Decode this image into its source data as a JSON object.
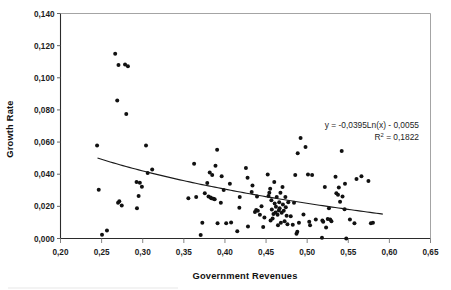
{
  "chart_data": {
    "type": "scatter",
    "title": "",
    "xlabel": "Government Revenues",
    "ylabel": "Growth Rate",
    "xlim": [
      0.2,
      0.65
    ],
    "ylim": [
      0.0,
      0.14
    ],
    "grid": false,
    "legend": null,
    "x_ticks": [
      "0,20",
      "0,25",
      "0,30",
      "0,35",
      "0,40",
      "0,45",
      "0,50",
      "0,55",
      "0,60",
      "0,65"
    ],
    "x_tick_values": [
      0.2,
      0.25,
      0.3,
      0.35,
      0.4,
      0.45,
      0.5,
      0.55,
      0.6,
      0.65
    ],
    "y_ticks": [
      "0,000",
      "0,020",
      "0,040",
      "0,060",
      "0,080",
      "0,100",
      "0,120",
      "0,140"
    ],
    "y_tick_values": [
      0.0,
      0.02,
      0.04,
      0.06,
      0.08,
      0.1,
      0.12,
      0.14
    ],
    "decimal_separator": ",",
    "annotations": {
      "equation": "y = -0,0395Ln(x) - 0,0055",
      "equation_prefix": "y = -0,0395Ln(x) - 0,0055",
      "r_squared_prefix": "R",
      "r_squared_sup": "2",
      "r_squared_value": " = 0,1822",
      "r_squared_full": "R² = 0,1822",
      "position": "upper-right"
    },
    "trendline": {
      "type": "logarithmic",
      "equation": "y = -0.0395*ln(x) - 0.0055",
      "coefficient": -0.0395,
      "intercept": -0.0055,
      "r_squared": 0.1822,
      "x_start": 0.245,
      "x_end": 0.592,
      "color": "#1a1a1a"
    },
    "marker": {
      "shape": "circle",
      "color": "#111111",
      "size": 2.0
    },
    "series": [
      {
        "name": "Countries",
        "points": [
          [
            0.2445,
            0.0578
          ],
          [
            0.2465,
            0.0303
          ],
          [
            0.2505,
            0.0023
          ],
          [
            0.2565,
            0.005
          ],
          [
            0.2665,
            0.115
          ],
          [
            0.269,
            0.0858
          ],
          [
            0.27,
            0.0222
          ],
          [
            0.2705,
            0.108
          ],
          [
            0.2715,
            0.0232
          ],
          [
            0.2745,
            0.0205
          ],
          [
            0.2785,
            0.1082
          ],
          [
            0.28,
            0.0775
          ],
          [
            0.282,
            0.1072
          ],
          [
            0.2925,
            0.0352
          ],
          [
            0.293,
            0.0188
          ],
          [
            0.295,
            0.0265
          ],
          [
            0.2965,
            0.0347
          ],
          [
            0.299,
            0.0322
          ],
          [
            0.304,
            0.0578
          ],
          [
            0.306,
            0.0408
          ],
          [
            0.3115,
            0.043
          ],
          [
            0.3555,
            0.025
          ],
          [
            0.3625,
            0.0465
          ],
          [
            0.365,
            0.0258
          ],
          [
            0.3705,
            0.0022
          ],
          [
            0.3725,
            0.0098
          ],
          [
            0.3755,
            0.0282
          ],
          [
            0.3785,
            0.0345
          ],
          [
            0.38,
            0.0262
          ],
          [
            0.3815,
            0.041
          ],
          [
            0.3825,
            0.0255
          ],
          [
            0.3835,
            0.025
          ],
          [
            0.3845,
            0.0395
          ],
          [
            0.386,
            0.0248
          ],
          [
            0.3875,
            0.0245
          ],
          [
            0.3885,
            0.0452
          ],
          [
            0.3905,
            0.0553
          ],
          [
            0.391,
            0.0095
          ],
          [
            0.395,
            0.0222
          ],
          [
            0.396,
            0.0388
          ],
          [
            0.3985,
            0.0302
          ],
          [
            0.4015,
            0.0095
          ],
          [
            0.406,
            0.034
          ],
          [
            0.4075,
            0.01
          ],
          [
            0.415,
            0.0045
          ],
          [
            0.4175,
            0.0192
          ],
          [
            0.418,
            0.0258
          ],
          [
            0.4255,
            0.0438
          ],
          [
            0.4275,
            0.0378
          ],
          [
            0.428,
            0.0075
          ],
          [
            0.4325,
            0.029
          ],
          [
            0.4335,
            0.033
          ],
          [
            0.4365,
            0.0165
          ],
          [
            0.438,
            0.0178
          ],
          [
            0.439,
            0.0262
          ],
          [
            0.44,
            0.0172
          ],
          [
            0.4425,
            0.0148
          ],
          [
            0.4445,
            0.02
          ],
          [
            0.4465,
            0.0072
          ],
          [
            0.448,
            0.013
          ],
          [
            0.452,
            0.0398
          ],
          [
            0.453,
            0.0265
          ],
          [
            0.454,
            0.0285
          ],
          [
            0.455,
            0.031
          ],
          [
            0.4555,
            0.0112
          ],
          [
            0.4565,
            0.0238
          ],
          [
            0.457,
            0.018
          ],
          [
            0.458,
            0.0125
          ],
          [
            0.459,
            0.0152
          ],
          [
            0.46,
            0.0352
          ],
          [
            0.4605,
            0.0218
          ],
          [
            0.4615,
            0.0162
          ],
          [
            0.462,
            0.0198
          ],
          [
            0.463,
            0.0258
          ],
          [
            0.464,
            0.0148
          ],
          [
            0.4645,
            0.0082
          ],
          [
            0.4655,
            0.0175
          ],
          [
            0.466,
            0.0225
          ],
          [
            0.4665,
            0.0188
          ],
          [
            0.4675,
            0.0285
          ],
          [
            0.468,
            0.0098
          ],
          [
            0.469,
            0.016
          ],
          [
            0.47,
            0.032
          ],
          [
            0.4705,
            0.0212
          ],
          [
            0.4715,
            0.0172
          ],
          [
            0.4725,
            0.0108
          ],
          [
            0.4735,
            0.0258
          ],
          [
            0.474,
            0.0195
          ],
          [
            0.475,
            0.0142
          ],
          [
            0.476,
            0.0088
          ],
          [
            0.477,
            0.0225
          ],
          [
            0.48,
            0.0138
          ],
          [
            0.4825,
            0.0085
          ],
          [
            0.484,
            0.0222
          ],
          [
            0.4855,
            0.0395
          ],
          [
            0.487,
            0.003
          ],
          [
            0.488,
            0.0042
          ],
          [
            0.4885,
            0.053
          ],
          [
            0.49,
            0.0098
          ],
          [
            0.492,
            0.0625
          ],
          [
            0.4955,
            0.015
          ],
          [
            0.498,
            0.057
          ],
          [
            0.501,
            0.0398
          ],
          [
            0.5025,
            0.0105
          ],
          [
            0.5035,
            0.0082
          ],
          [
            0.506,
            0.0395
          ],
          [
            0.5105,
            0.0118
          ],
          [
            0.518,
            0.0005
          ],
          [
            0.5185,
            0.0112
          ],
          [
            0.5195,
            0.0105
          ],
          [
            0.5215,
            0.032
          ],
          [
            0.523,
            0.0068
          ],
          [
            0.525,
            0.0122
          ],
          [
            0.5265,
            0.0188
          ],
          [
            0.528,
            0.0118
          ],
          [
            0.5295,
            0.0108
          ],
          [
            0.5345,
            0.0385
          ],
          [
            0.5355,
            0.0282
          ],
          [
            0.5375,
            0.0272
          ],
          [
            0.5385,
            0.0318
          ],
          [
            0.54,
            0.0228
          ],
          [
            0.542,
            0.0545
          ],
          [
            0.543,
            0.0262
          ],
          [
            0.5455,
            0.0182
          ],
          [
            0.546,
            0.034
          ],
          [
            0.5475,
            0.0
          ],
          [
            0.552,
            0.0118
          ],
          [
            0.5575,
            0.0095
          ],
          [
            0.56,
            0.037
          ],
          [
            0.566,
            0.0388
          ],
          [
            0.5745,
            0.0358
          ],
          [
            0.5775,
            0.0095
          ],
          [
            0.58,
            0.0098
          ]
        ]
      }
    ]
  }
}
